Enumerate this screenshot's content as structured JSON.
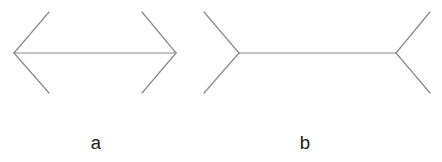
{
  "colors": {
    "line": "#8a8a8a",
    "label": "#222222",
    "background": "#ffffff"
  },
  "figures": [
    {
      "id": "a",
      "label": "a",
      "style": "arrowheads-outward",
      "shaft": {
        "x1": 14,
        "y1": 53,
        "x2": 176,
        "y2": 53
      },
      "fins": [
        {
          "x1": 14,
          "y1": 53,
          "x2": 49,
          "y2": 12
        },
        {
          "x1": 14,
          "y1": 53,
          "x2": 49,
          "y2": 93
        },
        {
          "x1": 176,
          "y1": 53,
          "x2": 142,
          "y2": 12
        },
        {
          "x1": 176,
          "y1": 53,
          "x2": 142,
          "y2": 93
        }
      ]
    },
    {
      "id": "b",
      "label": "b",
      "style": "fins-outward",
      "shaft": {
        "x1": 239,
        "y1": 53,
        "x2": 396,
        "y2": 53
      },
      "fins": [
        {
          "x1": 239,
          "y1": 53,
          "x2": 204,
          "y2": 12
        },
        {
          "x1": 239,
          "y1": 53,
          "x2": 204,
          "y2": 93
        },
        {
          "x1": 396,
          "y1": 53,
          "x2": 430,
          "y2": 12
        },
        {
          "x1": 396,
          "y1": 53,
          "x2": 430,
          "y2": 93
        }
      ]
    }
  ]
}
